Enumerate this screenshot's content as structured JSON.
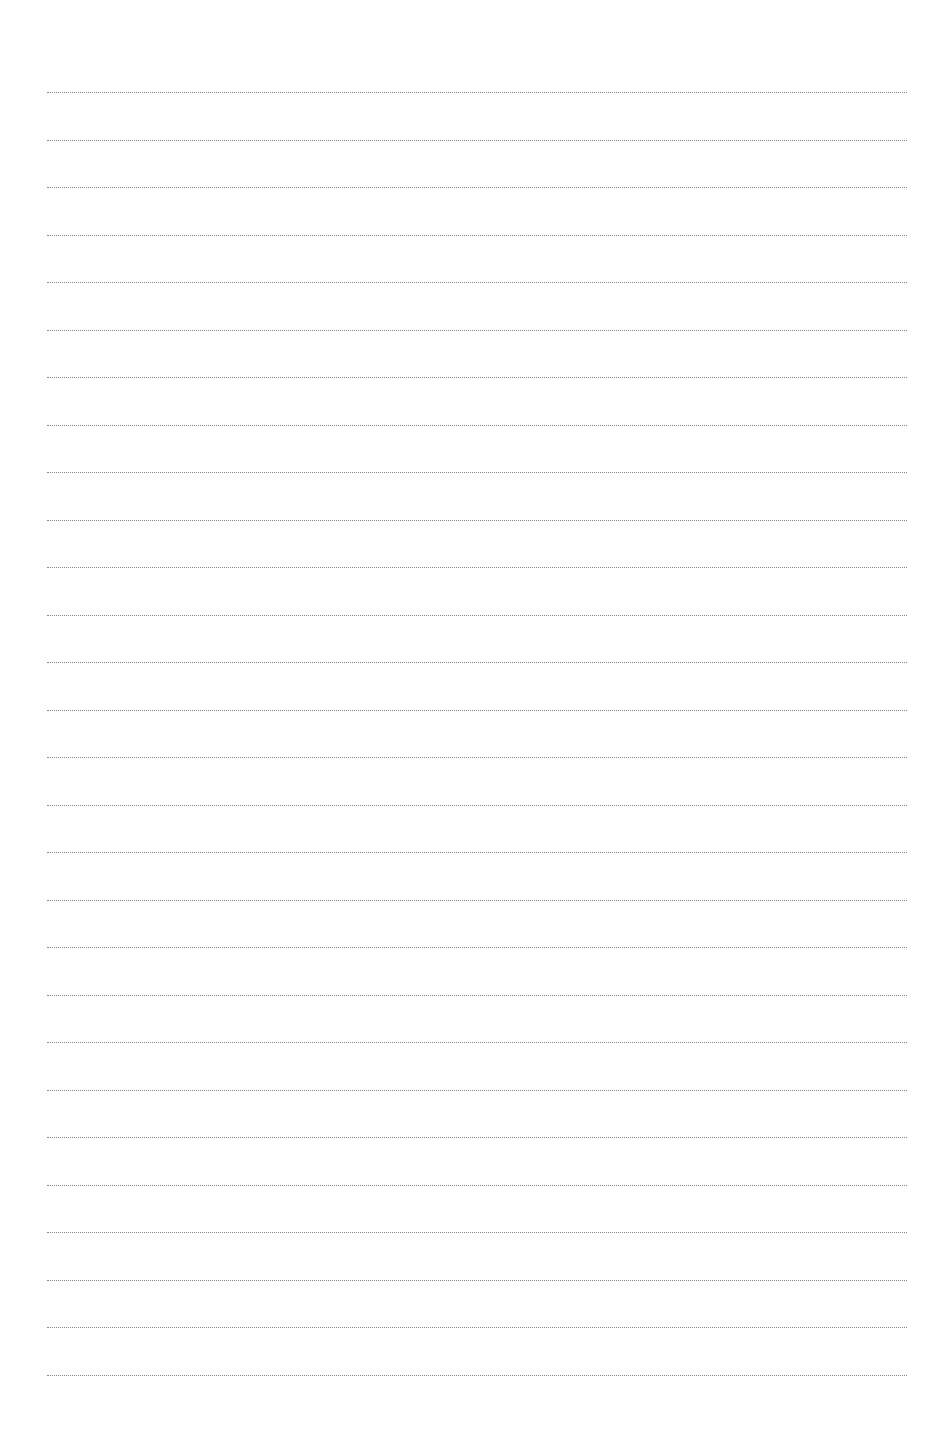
{
  "page": {
    "type": "blank lined writing page",
    "rule_style": "dotted",
    "rule_color": "#8a8a8a",
    "rule_count": 28,
    "first_rule_y": 92,
    "rule_spacing": 47.5,
    "rule_left": 47,
    "rule_width": 860
  }
}
